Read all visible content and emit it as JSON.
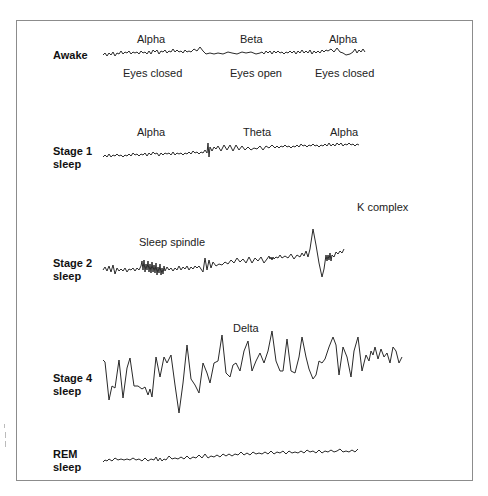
{
  "figure": {
    "stroke_color": "#2a2a2a",
    "frame_color": "#8c8c8c"
  },
  "rows": [
    {
      "id": "awake",
      "stage_label_lines": [
        "Awake"
      ],
      "annotations_above": [
        "Alpha",
        "Beta",
        "Alpha"
      ],
      "annotations_below": [
        "Eyes closed",
        "Eyes open",
        "Eyes closed"
      ]
    },
    {
      "id": "stage1",
      "stage_label_lines": [
        "Stage 1",
        "sleep"
      ],
      "annotations_above": [
        "Alpha",
        "Theta",
        "Alpha"
      ]
    },
    {
      "id": "stage2",
      "stage_label_lines": [
        "Stage 2",
        "sleep"
      ],
      "annotations_above": [
        "Sleep spindle",
        "K complex"
      ]
    },
    {
      "id": "stage4",
      "stage_label_lines": [
        "Stage 4",
        "sleep"
      ],
      "annotations_above": [
        "Delta"
      ]
    },
    {
      "id": "rem",
      "stage_label_lines": [
        "REM",
        "sleep"
      ],
      "annotations_above": []
    }
  ]
}
